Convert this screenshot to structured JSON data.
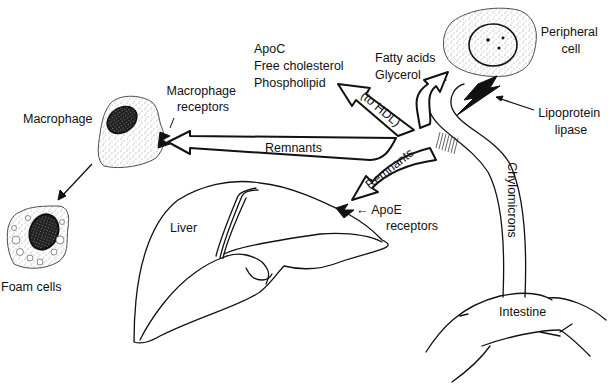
{
  "diagram": {
    "labels": {
      "peripheral_cell": [
        "Peripheral",
        "cell"
      ],
      "fatty_acids": [
        "Fatty acids",
        "Glycerol"
      ],
      "hdl_products": [
        "ApoC",
        "Free cholesterol",
        "Phospholipid"
      ],
      "to_hdl": "(to HDL)",
      "lipoprotein_lipase": [
        "Lipoprotein",
        "lipase"
      ],
      "macrophage": "Macrophage",
      "macrophage_receptors": [
        "Macrophage",
        "receptors"
      ],
      "remnants_horizontal": "Remnants",
      "remnants_curved": "Remnants",
      "chylomicrons": "Chylomicrons",
      "apoe_receptors": [
        "← ApoE",
        "receptors"
      ],
      "liver": "Liver",
      "intestine": "Intestine",
      "foam_cells": "Foam cells"
    },
    "nodes": [
      {
        "id": "intestine",
        "label": "Intestine"
      },
      {
        "id": "peripheral-cell",
        "label": "Peripheral cell"
      },
      {
        "id": "liver",
        "label": "Liver"
      },
      {
        "id": "macrophage",
        "label": "Macrophage"
      },
      {
        "id": "foam-cells",
        "label": "Foam cells"
      }
    ],
    "edges": [
      {
        "from": "intestine",
        "to": "peripheral-cell",
        "label": "Chylomicrons"
      },
      {
        "from": "chylomicron-branch",
        "to": "peripheral-cell",
        "label": "Fatty acids, Glycerol"
      },
      {
        "from": "chylomicron-branch",
        "to": "hdl",
        "label": "ApoC, Free cholesterol, Phospholipid (to HDL)"
      },
      {
        "from": "chylomicron-branch",
        "to": "macrophage",
        "label": "Remnants"
      },
      {
        "from": "chylomicron-branch",
        "to": "liver",
        "label": "Remnants"
      },
      {
        "from": "macrophage",
        "to": "foam-cells",
        "label": ""
      }
    ]
  }
}
